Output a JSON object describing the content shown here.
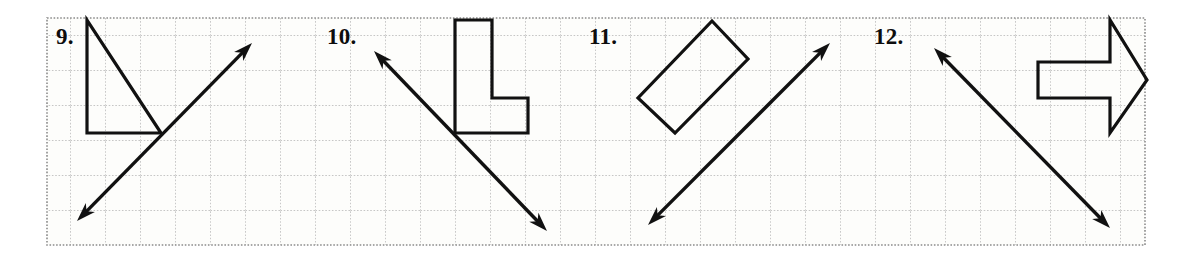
{
  "page": {
    "width": 1190,
    "height": 263,
    "background_color": "#ffffff"
  },
  "grid": {
    "x": 47,
    "y": 18,
    "width": 1098,
    "height": 227,
    "cell_size": 35,
    "columns": 31,
    "rows": 6,
    "line_color": "#b4b4b4",
    "border_color": "#8c8c8c",
    "line_style": "dotted",
    "fill_color": "#fdfdfb"
  },
  "ink": {
    "color": "#111111",
    "figure_stroke_width": 3.2,
    "arrow_stroke_width": 3.4
  },
  "problems": [
    {
      "number": "9.",
      "label_x": 56,
      "label_y": 25,
      "figure": {
        "name": "right-triangle",
        "type": "polygon",
        "points": [
          [
            87,
            20
          ],
          [
            87,
            133
          ],
          [
            161,
            133
          ]
        ],
        "closed": true
      },
      "line": {
        "name": "double-headed-arrow",
        "from": [
          77,
          221
        ],
        "to": [
          252,
          43
        ],
        "heads": "both"
      }
    },
    {
      "number": "10.",
      "label_x": 327,
      "label_y": 25,
      "figure": {
        "name": "l-shape-pentomino",
        "type": "polygon",
        "points": [
          [
            455,
            20
          ],
          [
            492,
            20
          ],
          [
            492,
            98
          ],
          [
            528,
            98
          ],
          [
            528,
            133
          ],
          [
            455,
            133
          ]
        ],
        "closed": true
      },
      "line": {
        "name": "double-headed-arrow",
        "from": [
          374,
          51
        ],
        "to": [
          547,
          231
        ],
        "heads": "both"
      }
    },
    {
      "number": "11.",
      "label_x": 589,
      "label_y": 25,
      "figure": {
        "name": "rotated-rectangle",
        "type": "polygon",
        "points": [
          [
            712,
            21
          ],
          [
            748,
            59
          ],
          [
            675,
            133
          ],
          [
            638,
            98
          ]
        ],
        "closed": true
      },
      "line": {
        "name": "double-headed-arrow",
        "from": [
          648,
          225
        ],
        "to": [
          830,
          43
        ],
        "heads": "both"
      }
    },
    {
      "number": "12.",
      "label_x": 874,
      "label_y": 25,
      "figure": {
        "name": "block-arrow-pointing-right",
        "type": "polygon",
        "points": [
          [
            1038,
            62
          ],
          [
            1110,
            62
          ],
          [
            1110,
            20
          ],
          [
            1147,
            80
          ],
          [
            1110,
            133
          ],
          [
            1110,
            98
          ],
          [
            1038,
            98
          ]
        ],
        "closed": true
      },
      "line": {
        "name": "double-headed-arrow",
        "from": [
          934,
          48
        ],
        "to": [
          1110,
          228
        ],
        "heads": "both"
      }
    }
  ]
}
